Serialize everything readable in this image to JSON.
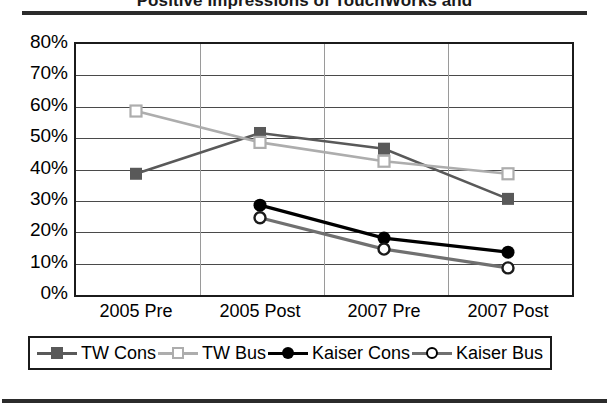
{
  "figure": {
    "title": "Positive Impressions of TouchWorks and"
  },
  "chart_data": {
    "type": "line",
    "title": "Positive Impressions of TouchWorks and",
    "xlabel": "",
    "ylabel": "",
    "ylim": [
      0,
      80
    ],
    "ytick_labels": [
      "80%",
      "70%",
      "60%",
      "50%",
      "40%",
      "30%",
      "20%",
      "10%",
      "0%"
    ],
    "ytick_values": [
      80,
      70,
      60,
      50,
      40,
      30,
      20,
      10,
      0
    ],
    "grid": true,
    "legend_position": "bottom",
    "categories": [
      "2005 Pre",
      "2005 Post",
      "2007 Pre",
      "2007 Post"
    ],
    "series": [
      {
        "name": "TW Cons",
        "color": "#595959",
        "marker": "square-filled",
        "values": [
          38,
          51,
          46,
          30
        ]
      },
      {
        "name": "TW Bus",
        "color": "#adadad",
        "marker": "square-open",
        "values": [
          58,
          48,
          42,
          38
        ]
      },
      {
        "name": "Kaiser Cons",
        "color": "#000000",
        "marker": "circle-filled",
        "values": [
          null,
          28,
          17.5,
          13
        ]
      },
      {
        "name": "Kaiser Bus",
        "color": "#707070",
        "marker": "circle-open",
        "values": [
          null,
          24,
          14,
          8
        ]
      }
    ]
  }
}
